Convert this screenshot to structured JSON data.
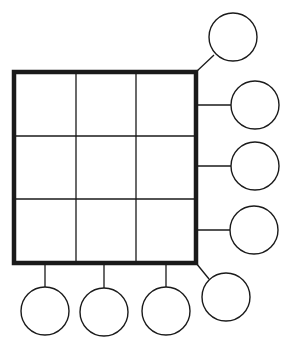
{
  "diagram": {
    "type": "grid-with-satellite-circles",
    "grid": {
      "rows": 3,
      "cols": 3,
      "x": 14,
      "y": 72,
      "width": 182,
      "height": 191,
      "col_lines": [
        76,
        136
      ],
      "row_lines": [
        136,
        199
      ]
    },
    "circles": [
      {
        "id": "top-right-diagonal",
        "cx": 233,
        "cy": 37,
        "r": 24,
        "connector": [
          196,
          72,
          214,
          55
        ]
      },
      {
        "id": "right-1",
        "cx": 255,
        "cy": 105,
        "r": 24,
        "connector": [
          196,
          105,
          231,
          105
        ]
      },
      {
        "id": "right-2",
        "cx": 255,
        "cy": 166,
        "r": 24,
        "connector": [
          196,
          166,
          231,
          166
        ]
      },
      {
        "id": "right-3",
        "cx": 254,
        "cy": 230,
        "r": 24,
        "connector": [
          196,
          230,
          230,
          230
        ]
      },
      {
        "id": "bottom-right-diagonal",
        "cx": 226,
        "cy": 297,
        "r": 24,
        "connector": [
          196,
          263,
          209,
          279
        ]
      },
      {
        "id": "bottom-1",
        "cx": 45,
        "cy": 311,
        "r": 24,
        "connector": [
          45,
          263,
          45,
          287
        ]
      },
      {
        "id": "bottom-2",
        "cx": 104,
        "cy": 312,
        "r": 24,
        "connector": [
          104,
          263,
          104,
          288
        ]
      },
      {
        "id": "bottom-3",
        "cx": 166,
        "cy": 311,
        "r": 24,
        "connector": [
          166,
          263,
          166,
          287
        ]
      }
    ],
    "colors": {
      "stroke": "#1a1a1a",
      "background": "#ffffff"
    }
  }
}
